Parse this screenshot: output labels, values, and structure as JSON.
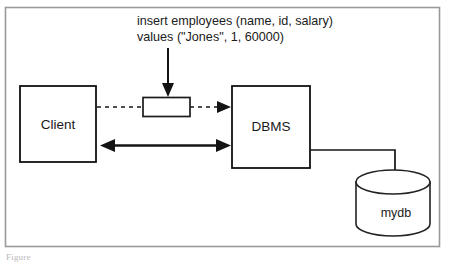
{
  "figure": {
    "background_color": "#ffffff",
    "frame_color": "#9a9a9a",
    "line_color": "#141414"
  },
  "query": {
    "line1": "insert employees (name, id, salary)",
    "line2": "values (\"Jones\", 1, 60000)"
  },
  "nodes": {
    "client": {
      "label": "Client"
    },
    "dbms": {
      "label": "DBMS"
    },
    "database": {
      "label": "mydb"
    },
    "packet": {
      "label": ""
    }
  },
  "caption": {
    "text": "Figure"
  }
}
